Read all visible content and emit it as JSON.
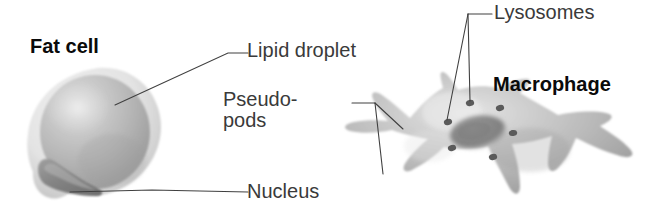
{
  "figure": {
    "background": "#ffffff",
    "width": 654,
    "height": 221
  },
  "labels": {
    "fat_cell": "Fat cell",
    "lipid_droplet": "Lipid droplet",
    "pseudopods_line1": "Pseudo-",
    "pseudopods_line2": "pods",
    "nucleus": "Nucleus",
    "lysosomes": "Lysosomes",
    "macrophage": "Macrophage"
  },
  "style": {
    "label_color": "#3a3a3a",
    "bold_label_color": "#0a0a0a",
    "leader_line_color": "#404040",
    "cell_light": "#e8e8e8",
    "cell_mid": "#b6b6b6",
    "cell_dark": "#8d8d8d",
    "nucleus_dark": "#7a7a7a",
    "lysosome_dot": "#5b5b5b"
  },
  "diagram_parts": {
    "fat_cell": {
      "name": "Fat cell",
      "bold": true,
      "structures": [
        {
          "name": "lipid droplet",
          "note": "large pale-gray sphere filling the cell"
        },
        {
          "name": "nucleus",
          "note": "dark crescent at lower-left, flattened by the droplet"
        },
        {
          "name": "plasma membrane",
          "note": "thin light rim around droplet"
        }
      ]
    },
    "macrophage": {
      "name": "Macrophage",
      "bold": true,
      "structures": [
        {
          "name": "pseudopods",
          "count": 7,
          "note": "finger-like projections radiating from cell body"
        },
        {
          "name": "lysosomes",
          "count": 7,
          "note": "small dark round granules in cytoplasm"
        },
        {
          "name": "nucleus",
          "count": 1,
          "note": "darker oval mass near cell centre"
        }
      ]
    }
  },
  "leaders": {
    "lipid_droplet": {
      "from": [
        115,
        105
      ],
      "to": [
        248,
        52
      ],
      "style": "elbow"
    },
    "nucleus": {
      "from": [
        70,
        192
      ],
      "to": [
        248,
        192
      ],
      "style": "elbow"
    },
    "pseudopods": {
      "vertex": [
        375,
        103
      ],
      "branches": [
        [
          402,
          129
        ],
        [
          383,
          174
        ]
      ],
      "style": "fork"
    },
    "lysosomes": {
      "vertex": [
        468,
        14
      ],
      "branches": [
        [
          447,
          122
        ],
        [
          470,
          103
        ]
      ],
      "style": "fork"
    }
  }
}
